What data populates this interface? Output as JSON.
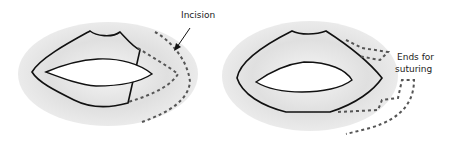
{
  "figure": {
    "left_panel": {
      "label": "Incision"
    },
    "right_panel": {
      "label_line1": "Ends for",
      "label_line2": "suturing"
    },
    "colors": {
      "outline": "#111111",
      "dashed": "#555555",
      "shading": "#cfcfcf",
      "shading_light": "#e6e6e6"
    }
  }
}
